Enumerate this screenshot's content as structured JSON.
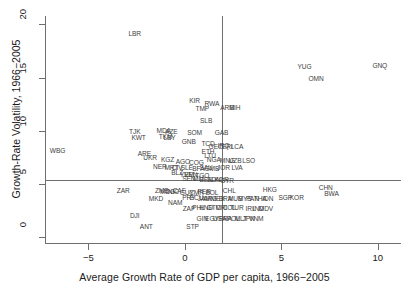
{
  "chart_data": {
    "type": "scatter",
    "title": "",
    "xlabel": "Average Growth Rate of GDP per capita, 1966−2005",
    "ylabel": "Growth-Rate Volatility, 1966−2005",
    "xlim": [
      -7.2,
      11.2
    ],
    "ylim": [
      -0.6,
      20.8
    ],
    "xticks": [
      -5,
      0,
      5,
      10
    ],
    "xtick_labels": [
      "−5",
      "0",
      "5",
      "10"
    ],
    "yticks": [
      0,
      5,
      10,
      15,
      20
    ],
    "ytick_labels": [
      "0",
      "5",
      "10",
      "15",
      "20"
    ],
    "grid": false,
    "legend": "none",
    "marker": "text-label",
    "reference_lines": [
      {
        "orientation": "horizontal",
        "value": 5.3,
        "label": "mean-volatility"
      },
      {
        "orientation": "vertical",
        "value": 1.9,
        "label": "mean-growth"
      }
    ],
    "point_label_field": "iso3",
    "points": [
      {
        "iso3": "LBR",
        "x": -2.6,
        "y": 19.2
      },
      {
        "iso3": "GNQ",
        "x": 10.1,
        "y": 16.2
      },
      {
        "iso3": "YUG",
        "x": 6.2,
        "y": 16.1
      },
      {
        "iso3": "OMN",
        "x": 6.8,
        "y": 15.0
      },
      {
        "iso3": "KIR",
        "x": 0.5,
        "y": 12.9
      },
      {
        "iso3": "RWA",
        "x": 1.4,
        "y": 12.6
      },
      {
        "iso3": "ARM",
        "x": 2.2,
        "y": 12.2
      },
      {
        "iso3": "BIH",
        "x": 2.6,
        "y": 12.2
      },
      {
        "iso3": "TMP",
        "x": 0.9,
        "y": 12.1
      },
      {
        "iso3": "SLB",
        "x": 1.1,
        "y": 11.0
      },
      {
        "iso3": "MDA",
        "x": -1.1,
        "y": 10.1
      },
      {
        "iso3": "AZE",
        "x": -0.7,
        "y": 10.0
      },
      {
        "iso3": "SOM",
        "x": 0.5,
        "y": 9.9
      },
      {
        "iso3": "GAB",
        "x": 1.9,
        "y": 9.9
      },
      {
        "iso3": "TJK",
        "x": -2.6,
        "y": 10.0
      },
      {
        "iso3": "TKM",
        "x": -1.0,
        "y": 9.5
      },
      {
        "iso3": "LBY",
        "x": -0.8,
        "y": 9.4
      },
      {
        "iso3": "KWT",
        "x": -2.4,
        "y": 9.4
      },
      {
        "iso3": "GNB",
        "x": 0.2,
        "y": 9.0
      },
      {
        "iso3": "TCD",
        "x": 1.2,
        "y": 8.8
      },
      {
        "iso3": "GEO",
        "x": 1.6,
        "y": 8.5
      },
      {
        "iso3": "IRQ",
        "x": 2.0,
        "y": 8.6
      },
      {
        "iso3": "ERI",
        "x": 2.2,
        "y": 8.5
      },
      {
        "iso3": "LCA",
        "x": 2.7,
        "y": 8.5
      },
      {
        "iso3": "WBG",
        "x": -6.6,
        "y": 8.2
      },
      {
        "iso3": "ETH",
        "x": 1.2,
        "y": 8.1
      },
      {
        "iso3": "ARE",
        "x": -2.1,
        "y": 7.9
      },
      {
        "iso3": "UKR",
        "x": -1.8,
        "y": 7.5
      },
      {
        "iso3": "LTU",
        "x": 1.3,
        "y": 7.7
      },
      {
        "iso3": "NGA",
        "x": 1.5,
        "y": 7.3
      },
      {
        "iso3": "KGZ",
        "x": -0.9,
        "y": 7.3
      },
      {
        "iso3": "AGO",
        "x": -0.1,
        "y": 7.1
      },
      {
        "iso3": "COG",
        "x": 0.6,
        "y": 7.0
      },
      {
        "iso3": "MNG",
        "x": 2.2,
        "y": 7.2
      },
      {
        "iso3": "UZB",
        "x": 2.6,
        "y": 7.2
      },
      {
        "iso3": "LSO",
        "x": 3.3,
        "y": 7.2
      },
      {
        "iso3": "NER",
        "x": -1.3,
        "y": 6.7
      },
      {
        "iso3": "MRT",
        "x": -0.7,
        "y": 6.6
      },
      {
        "iso3": "CIV",
        "x": -0.4,
        "y": 6.6
      },
      {
        "iso3": "SLE",
        "x": 0.1,
        "y": 6.6
      },
      {
        "iso3": "BFA",
        "x": 0.7,
        "y": 6.5
      },
      {
        "iso3": "SAU",
        "x": 1.1,
        "y": 6.6
      },
      {
        "iso3": "GMB",
        "x": 1.4,
        "y": 6.5
      },
      {
        "iso3": "JOR",
        "x": 2.0,
        "y": 6.6
      },
      {
        "iso3": "LVA",
        "x": 2.7,
        "y": 6.6
      },
      {
        "iso3": "BLZ",
        "x": -0.4,
        "y": 6.1
      },
      {
        "iso3": "YEM",
        "x": 0.1,
        "y": 5.9
      },
      {
        "iso3": "VEN",
        "x": 0.3,
        "y": 5.9
      },
      {
        "iso3": "TGO",
        "x": 0.9,
        "y": 5.8
      },
      {
        "iso3": "SEN",
        "x": 0.2,
        "y": 5.5
      },
      {
        "iso3": "MLI",
        "x": 0.7,
        "y": 5.5
      },
      {
        "iso3": "BEN",
        "x": 1.1,
        "y": 5.4
      },
      {
        "iso3": "SDN",
        "x": 1.5,
        "y": 5.4
      },
      {
        "iso3": "KOR",
        "x": 1.9,
        "y": 5.4
      },
      {
        "iso3": "SYR",
        "x": 2.2,
        "y": 5.3
      },
      {
        "iso3": "ZAR",
        "x": -3.2,
        "y": 4.4
      },
      {
        "iso3": "ZMB",
        "x": -1.2,
        "y": 4.4
      },
      {
        "iso3": "MDG",
        "x": -0.9,
        "y": 4.3
      },
      {
        "iso3": "NIC",
        "x": -0.6,
        "y": 4.3
      },
      {
        "iso3": "CAF",
        "x": -0.3,
        "y": 4.4
      },
      {
        "iso3": "GUY",
        "x": 0.1,
        "y": 4.2
      },
      {
        "iso3": "CMR",
        "x": 0.6,
        "y": 4.2
      },
      {
        "iso3": "PER",
        "x": 1.0,
        "y": 4.3
      },
      {
        "iso3": "BOL",
        "x": 1.4,
        "y": 4.2
      },
      {
        "iso3": "CHL",
        "x": 2.3,
        "y": 4.4
      },
      {
        "iso3": "HKG",
        "x": 4.4,
        "y": 4.5
      },
      {
        "iso3": "CHN",
        "x": 7.3,
        "y": 4.7
      },
      {
        "iso3": "BWA",
        "x": 7.6,
        "y": 4.1
      },
      {
        "iso3": "MKD",
        "x": -1.5,
        "y": 3.6
      },
      {
        "iso3": "NAM",
        "x": -0.5,
        "y": 3.3
      },
      {
        "iso3": "PRY",
        "x": 0.2,
        "y": 3.7
      },
      {
        "iso3": "ECU",
        "x": 0.6,
        "y": 3.7
      },
      {
        "iso3": "JAM",
        "x": 1.0,
        "y": 3.6
      },
      {
        "iso3": "ARG",
        "x": 1.3,
        "y": 3.6
      },
      {
        "iso3": "MEX",
        "x": 1.7,
        "y": 3.6
      },
      {
        "iso3": "BRA",
        "x": 2.1,
        "y": 3.6
      },
      {
        "iso3": "MUS",
        "x": 2.6,
        "y": 3.6
      },
      {
        "iso3": "MYS",
        "x": 3.1,
        "y": 3.6
      },
      {
        "iso3": "PAN",
        "x": 3.5,
        "y": 3.6
      },
      {
        "iso3": "THA",
        "x": 3.9,
        "y": 3.6
      },
      {
        "iso3": "IDN",
        "x": 4.3,
        "y": 3.6
      },
      {
        "iso3": "SGP",
        "x": 5.2,
        "y": 3.7
      },
      {
        "iso3": "KOR",
        "x": 5.8,
        "y": 3.7
      },
      {
        "iso3": "ZAF",
        "x": 0.2,
        "y": 2.7
      },
      {
        "iso3": "PHL",
        "x": 0.7,
        "y": 2.8
      },
      {
        "iso3": "HND",
        "x": 1.1,
        "y": 2.8
      },
      {
        "iso3": "GTM",
        "x": 1.5,
        "y": 2.8
      },
      {
        "iso3": "CRI",
        "x": 1.9,
        "y": 2.8
      },
      {
        "iso3": "COL",
        "x": 2.3,
        "y": 2.8
      },
      {
        "iso3": "TUR",
        "x": 2.7,
        "y": 2.8
      },
      {
        "iso3": "IRL",
        "x": 3.4,
        "y": 2.7
      },
      {
        "iso3": "IND",
        "x": 3.8,
        "y": 2.7
      },
      {
        "iso3": "MDV",
        "x": 4.2,
        "y": 2.7
      },
      {
        "iso3": "DJI",
        "x": -2.6,
        "y": 2.0
      },
      {
        "iso3": "GIN",
        "x": 0.9,
        "y": 1.8
      },
      {
        "iso3": "EGY",
        "x": 1.4,
        "y": 1.8
      },
      {
        "iso3": "USA",
        "x": 1.8,
        "y": 1.8
      },
      {
        "iso3": "FRA",
        "x": 2.1,
        "y": 1.8
      },
      {
        "iso3": "POL",
        "x": 2.5,
        "y": 1.8
      },
      {
        "iso3": "MLT",
        "x": 2.9,
        "y": 1.8
      },
      {
        "iso3": "JPN",
        "x": 3.3,
        "y": 1.8
      },
      {
        "iso3": "VNM",
        "x": 3.7,
        "y": 1.8
      },
      {
        "iso3": "ANT",
        "x": -2.0,
        "y": 1.0
      },
      {
        "iso3": "STP",
        "x": 0.4,
        "y": 1.0
      }
    ]
  },
  "axes": {
    "x_label": "Average Growth Rate of GDP per capita, 1966−2005",
    "y_label": "Growth-Rate Volatility, 1966−2005"
  }
}
